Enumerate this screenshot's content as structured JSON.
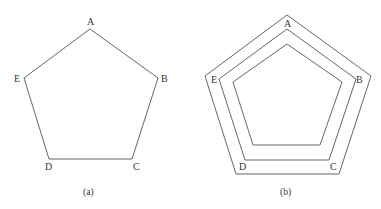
{
  "figure_a": {
    "caption": "(a)",
    "vertices": {
      "A": "A",
      "B": "B",
      "C": "C",
      "D": "D",
      "E": "E"
    }
  },
  "figure_b": {
    "caption": "(b)",
    "vertices": {
      "A": "A",
      "B": "B",
      "C": "C",
      "D": "D",
      "E": "E"
    }
  },
  "colors": {
    "stroke": "#555555",
    "text": "#333333",
    "background": "#ffffff"
  }
}
